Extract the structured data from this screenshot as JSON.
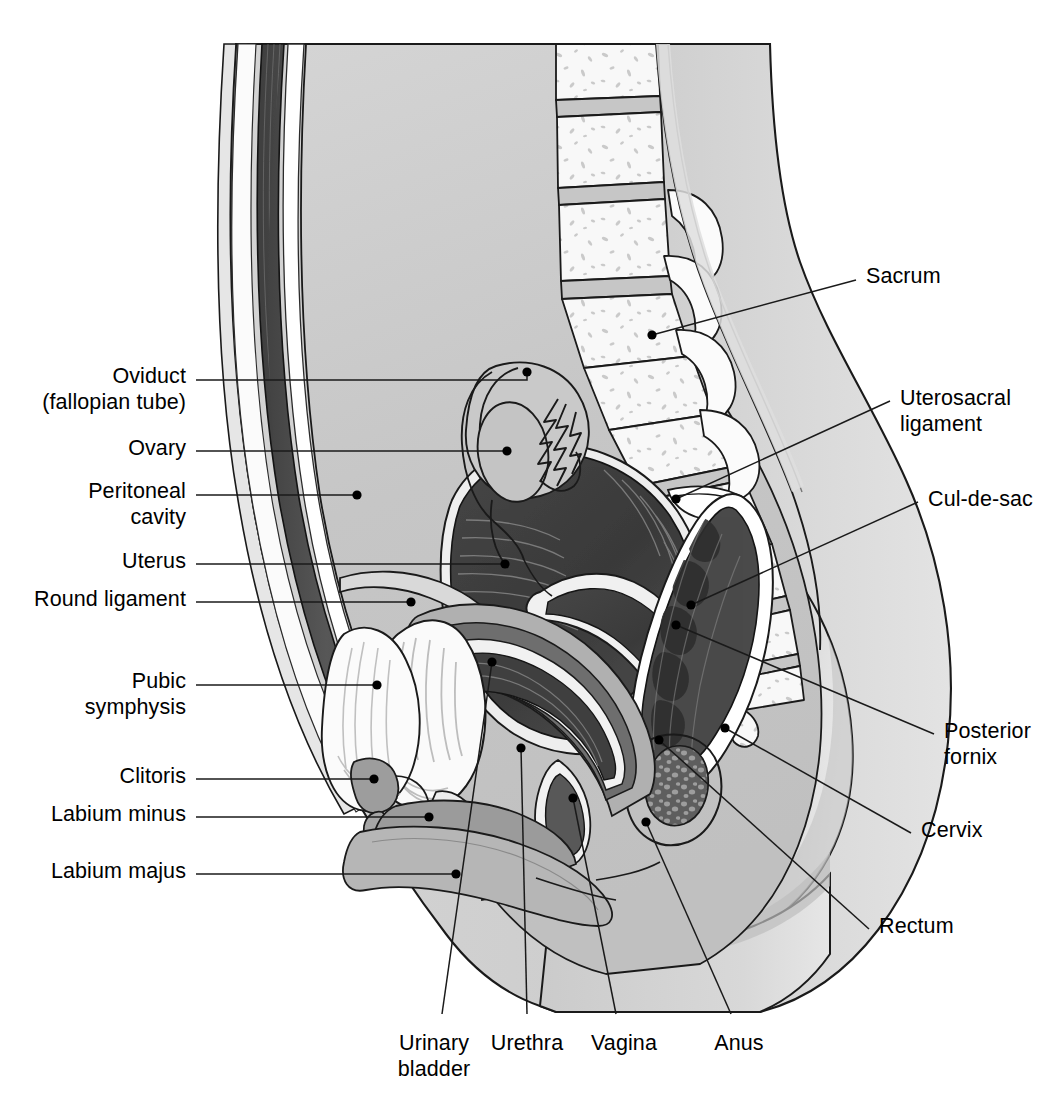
{
  "figure": {
    "view": "sagittal",
    "palette": {
      "background": "#ffffff",
      "outline": "#000000",
      "skin": "#d9d9d9",
      "body_shade": "#cfcfcf",
      "peritoneal_cavity": "#c6c6c6",
      "abdominal_muscle": "#4f4f4f",
      "bone_fill": "#f7f7f7",
      "bone_speckle": "#c9c9c9",
      "disc_gray": "#c2c2c2",
      "uterus_dark": "#3b3b3b",
      "uterus_mid": "#5a5a5a",
      "endometrium": "#efefef",
      "bladder_fill": "#f5f5f5",
      "bladder_line": "#b6b6b6",
      "vagina_mid": "#8e8e8e",
      "vagina_dark": "#4a4a4a",
      "rectum_dark": "#4b4b4b",
      "rectum_mid": "#6e6e6e",
      "labia": "#9a9a9a",
      "clitoris": "#8c8c8c",
      "feces": "#5d5d5d",
      "white_band": "#ffffff"
    }
  },
  "labels": {
    "left": [
      {
        "id": "oviduct",
        "lines": [
          "Oviduct",
          "(fallopian tube)"
        ],
        "text_x": 186,
        "text_y": 363,
        "leader": [
          [
            196,
            380
          ],
          [
            527,
            380
          ],
          [
            527,
            372
          ]
        ],
        "dot": [
          527,
          372
        ]
      },
      {
        "id": "ovary",
        "lines": [
          "Ovary"
        ],
        "text_x": 186,
        "text_y": 435,
        "leader": [
          [
            196,
            451
          ],
          [
            507,
            451
          ]
        ],
        "dot": [
          507,
          451
        ]
      },
      {
        "id": "peritoneal-cavity",
        "lines": [
          "Peritoneal",
          "cavity"
        ],
        "text_x": 186,
        "text_y": 478,
        "leader": [
          [
            196,
            495
          ],
          [
            357,
            495
          ]
        ],
        "dot": [
          357,
          495
        ]
      },
      {
        "id": "uterus",
        "lines": [
          "Uterus"
        ],
        "text_x": 186,
        "text_y": 548,
        "leader": [
          [
            196,
            564
          ],
          [
            505,
            564
          ]
        ],
        "dot": [
          505,
          564
        ]
      },
      {
        "id": "round-ligament",
        "lines": [
          "Round ligament"
        ],
        "text_x": 186,
        "text_y": 586,
        "leader": [
          [
            196,
            602
          ],
          [
            411,
            602
          ]
        ],
        "dot": [
          411,
          602
        ]
      },
      {
        "id": "pubic-symphysis",
        "lines": [
          "Pubic",
          "symphysis"
        ],
        "text_x": 186,
        "text_y": 668,
        "leader": [
          [
            196,
            685
          ],
          [
            377,
            685
          ]
        ],
        "dot": [
          377,
          685
        ]
      },
      {
        "id": "clitoris",
        "lines": [
          "Clitoris"
        ],
        "text_x": 186,
        "text_y": 763,
        "leader": [
          [
            196,
            779
          ],
          [
            374,
            779
          ]
        ],
        "dot": [
          374,
          779
        ]
      },
      {
        "id": "labium-minus",
        "lines": [
          "Labium minus"
        ],
        "text_x": 186,
        "text_y": 801,
        "leader": [
          [
            196,
            817
          ],
          [
            429,
            817
          ]
        ],
        "dot": [
          429,
          817
        ]
      },
      {
        "id": "labium-majus",
        "lines": [
          "Labium majus"
        ],
        "text_x": 186,
        "text_y": 858,
        "leader": [
          [
            196,
            874
          ],
          [
            456,
            874
          ]
        ],
        "dot": [
          456,
          874
        ]
      }
    ],
    "right": [
      {
        "id": "sacrum",
        "lines": [
          "Sacrum"
        ],
        "text_x": 866,
        "text_y": 263,
        "leader": [
          [
            856,
            280
          ],
          [
            652,
            335
          ]
        ],
        "dot": [
          652,
          335
        ]
      },
      {
        "id": "uterosacral-ligament",
        "lines": [
          "Uterosacral",
          "ligament"
        ],
        "text_x": 900,
        "text_y": 385,
        "leader": [
          [
            890,
            401
          ],
          [
            676,
            499
          ]
        ],
        "dot": [
          676,
          499
        ]
      },
      {
        "id": "cul-de-sac",
        "lines": [
          "Cul-de-sac"
        ],
        "text_x": 928,
        "text_y": 486,
        "leader": [
          [
            918,
            502
          ],
          [
            691,
            605
          ]
        ],
        "dot": [
          691,
          605
        ]
      },
      {
        "id": "posterior-fornix",
        "lines": [
          "Posterior",
          "fornix"
        ],
        "text_x": 944,
        "text_y": 718,
        "leader": [
          [
            934,
            734
          ],
          [
            676,
            625
          ]
        ],
        "dot": [
          676,
          625
        ]
      },
      {
        "id": "cervix",
        "lines": [
          "Cervix"
        ],
        "text_x": 921,
        "text_y": 817,
        "leader": [
          [
            911,
            833
          ],
          [
            725,
            728
          ]
        ],
        "dot": [
          725,
          728
        ]
      },
      {
        "id": "rectum",
        "lines": [
          "Rectum"
        ],
        "text_x": 879,
        "text_y": 913,
        "leader": [
          [
            869,
            929
          ],
          [
            659,
            740
          ]
        ],
        "dot": [
          659,
          740
        ]
      }
    ],
    "bottom": [
      {
        "id": "urinary-bladder",
        "lines": [
          "Urinary",
          "bladder"
        ],
        "text_cx": 434,
        "text_y": 1030,
        "leader": [
          [
            442,
            1014
          ],
          [
            492,
            662
          ]
        ],
        "dot": [
          492,
          662
        ]
      },
      {
        "id": "urethra",
        "lines": [
          "Urethra"
        ],
        "text_cx": 527,
        "text_y": 1030,
        "leader": [
          [
            527,
            1014
          ],
          [
            521,
            748
          ]
        ],
        "dot": [
          521,
          748
        ]
      },
      {
        "id": "vagina",
        "lines": [
          "Vagina"
        ],
        "text_cx": 624,
        "text_y": 1030,
        "leader": [
          [
            616,
            1014
          ],
          [
            573,
            798
          ]
        ],
        "dot": [
          573,
          798
        ]
      },
      {
        "id": "anus",
        "lines": [
          "Anus"
        ],
        "text_cx": 739,
        "text_y": 1030,
        "leader": [
          [
            731,
            1014
          ],
          [
            646,
            822
          ]
        ],
        "dot": [
          646,
          822
        ]
      }
    ]
  }
}
